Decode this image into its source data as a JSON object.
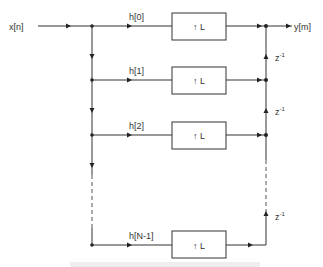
{
  "diagram": {
    "input_label": "x[n]",
    "output_label": "y[m]",
    "block_label": "↑ L",
    "delay_label": "z",
    "delay_exp": "-1",
    "branches": [
      {
        "coef": "h[0]",
        "y": 26
      },
      {
        "coef": "h[1]",
        "y": 80
      },
      {
        "coef": "h[2]",
        "y": 135
      },
      {
        "coef": "h[N-1]",
        "y": 245
      }
    ],
    "delays": [
      {
        "y": 57
      },
      {
        "y": 111
      },
      {
        "y": 218
      }
    ]
  }
}
